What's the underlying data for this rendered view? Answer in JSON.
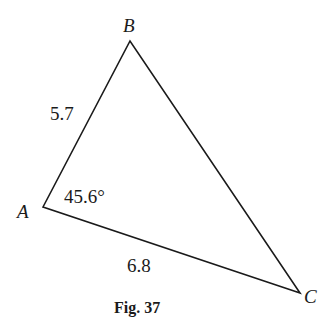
{
  "figure": {
    "caption": "Fig. 37",
    "vertices": {
      "A": {
        "label": "A",
        "x": 43,
        "y": 207
      },
      "B": {
        "label": "B",
        "x": 130,
        "y": 41
      },
      "C": {
        "label": "C",
        "x": 300,
        "y": 293
      }
    },
    "sides": {
      "AB": "5.7",
      "AC": "6.8"
    },
    "angles": {
      "A": "45.6°"
    },
    "stroke_color": "#1a1a1a"
  }
}
